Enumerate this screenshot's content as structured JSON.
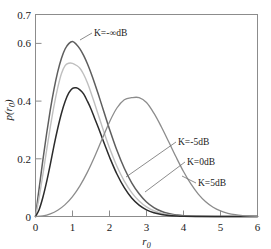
{
  "chart_data": {
    "type": "line",
    "title": "",
    "xlabel": "r₀",
    "ylabel": "p(r₀)",
    "xlim": [
      0,
      6
    ],
    "ylim": [
      0,
      0.7
    ],
    "grid": false,
    "legend_position": "inline-annotations",
    "xticks": [
      "0",
      "1",
      "2",
      "3",
      "4",
      "5",
      "6"
    ],
    "xtick_values": [
      0,
      1,
      2,
      3,
      4,
      5,
      6
    ],
    "yticks": [
      "0",
      "0.2",
      "0.4",
      "0.6",
      "0.7"
    ],
    "ytick_values": [
      0,
      0.2,
      0.4,
      0.6,
      0.7
    ],
    "series": [
      {
        "name": "K=-∞dB",
        "label": "K=-∞dB",
        "color": "#5e5e5e",
        "peak_x": 1.0,
        "peak_y": 0.607,
        "x": [
          0,
          0.1,
          0.2,
          0.3,
          0.4,
          0.5,
          0.6,
          0.7,
          0.8,
          0.9,
          1.0,
          1.1,
          1.2,
          1.3,
          1.4,
          1.5,
          1.6,
          1.7,
          1.8,
          1.9,
          2.0,
          2.2,
          2.4,
          2.6,
          2.8,
          3.0,
          3.2,
          3.4,
          3.6,
          3.8,
          4.0,
          4.5,
          5.0,
          5.5,
          6.0
        ],
        "values": [
          0,
          0.0995,
          0.196,
          0.2868,
          0.3692,
          0.4412,
          0.5011,
          0.5477,
          0.5804,
          0.5991,
          0.6065,
          0.5972,
          0.5809,
          0.5582,
          0.53,
          0.4972,
          0.461,
          0.4224,
          0.3825,
          0.3423,
          0.3027,
          0.2294,
          0.167,
          0.1168,
          0.0786,
          0.05,
          0.0306,
          0.018,
          0.0102,
          0.0055,
          0.0027,
          0.00046,
          5e-05,
          4e-06,
          1e-07
        ]
      },
      {
        "name": "K=-5dB",
        "label": "K=-5dB",
        "color": "#bfbfbf",
        "peak_x": 1.2,
        "peak_y": 0.531,
        "x": [
          0,
          0.1,
          0.2,
          0.3,
          0.4,
          0.5,
          0.6,
          0.7,
          0.8,
          0.9,
          1.0,
          1.1,
          1.2,
          1.3,
          1.4,
          1.5,
          1.6,
          1.7,
          1.8,
          1.9,
          2.0,
          2.2,
          2.4,
          2.6,
          2.8,
          3.0,
          3.2,
          3.4,
          3.6,
          3.8,
          4.0,
          4.5,
          5.0,
          5.5,
          6.0
        ],
        "values": [
          0,
          0.0672,
          0.146,
          0.229,
          0.3098,
          0.3834,
          0.4458,
          0.4948,
          0.5228,
          0.5312,
          0.5307,
          0.5242,
          0.5138,
          0.4931,
          0.464,
          0.4291,
          0.3908,
          0.3512,
          0.3118,
          0.2736,
          0.2376,
          0.174,
          0.1226,
          0.0829,
          0.0539,
          0.0335,
          0.0199,
          0.0113,
          0.0062,
          0.0032,
          0.0016,
          0.00024,
          2.6e-05,
          2e-06,
          5e-08
        ]
      },
      {
        "name": "K=0dB",
        "label": "K=0dB",
        "color": "#2b2b2b",
        "peak_x": 1.7,
        "peak_y": 0.446,
        "x": [
          0,
          0.1,
          0.2,
          0.3,
          0.4,
          0.5,
          0.6,
          0.7,
          0.8,
          0.9,
          1.0,
          1.1,
          1.2,
          1.3,
          1.4,
          1.5,
          1.6,
          1.7,
          1.8,
          1.9,
          2.0,
          2.2,
          2.4,
          2.6,
          2.8,
          3.0,
          3.2,
          3.4,
          3.6,
          3.8,
          4.0,
          4.5,
          5.0,
          5.5,
          6.0
        ],
        "values": [
          0,
          0.0246,
          0.0665,
          0.1198,
          0.1808,
          0.2456,
          0.3048,
          0.357,
          0.3986,
          0.4282,
          0.444,
          0.446,
          0.439,
          0.4248,
          0.4002,
          0.3728,
          0.3398,
          0.3073,
          0.2728,
          0.2392,
          0.2062,
          0.1472,
          0.0998,
          0.0642,
          0.0396,
          0.0232,
          0.013,
          0.007,
          0.0035,
          0.0017,
          0.0008,
          0.0001,
          1e-05,
          5e-07,
          1e-08
        ]
      },
      {
        "name": "K=5dB",
        "label": "K=5dB",
        "color": "#8c8c8c",
        "peak_x": 2.75,
        "peak_y": 0.412,
        "x": [
          0,
          0.2,
          0.4,
          0.6,
          0.8,
          1.0,
          1.2,
          1.4,
          1.6,
          1.8,
          2.0,
          2.2,
          2.4,
          2.6,
          2.8,
          3.0,
          3.2,
          3.4,
          3.6,
          3.8,
          4.0,
          4.2,
          4.4,
          4.6,
          4.8,
          5.0,
          5.2,
          5.4,
          5.6,
          5.8,
          6.0
        ],
        "values": [
          0,
          0.0022,
          0.0092,
          0.0218,
          0.0412,
          0.069,
          0.1062,
          0.1528,
          0.2078,
          0.2682,
          0.3278,
          0.376,
          0.4048,
          0.4118,
          0.412,
          0.395,
          0.358,
          0.311,
          0.259,
          0.206,
          0.156,
          0.1128,
          0.0778,
          0.0512,
          0.0322,
          0.0194,
          0.0112,
          0.0062,
          0.0033,
          0.0017,
          0.0008
        ]
      }
    ],
    "annotations": [
      {
        "text": "K=-∞dB",
        "target_x": 1.05,
        "target_y": 0.6
      },
      {
        "text": "K=-5dB",
        "target_x": 2.45,
        "target_y": 0.205
      },
      {
        "text": "K=0dB",
        "target_x": 2.95,
        "target_y": 0.125
      },
      {
        "text": "K=5dB",
        "target_x": 4.08,
        "target_y": 0.085
      }
    ]
  },
  "figure": {
    "y_axis_label": "p(r₀)",
    "x_axis_label": "r₀",
    "ylabel_main": "p",
    "ylabel_sub": "r",
    "ylabel_subsub": "0"
  }
}
